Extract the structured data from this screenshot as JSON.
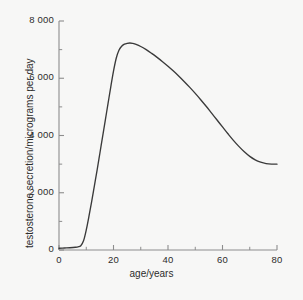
{
  "chart_data": {
    "type": "line",
    "title": "",
    "xlabel": "age/years",
    "ylabel": "testosterone secretion/micrograms per day",
    "xlim": [
      0,
      80
    ],
    "ylim": [
      0,
      8000
    ],
    "grid": false,
    "legend": null,
    "x_ticks": [
      0,
      20,
      40,
      60,
      80
    ],
    "x_tick_labels": [
      "0",
      "20",
      "40",
      "60",
      "80"
    ],
    "x_minor_ticks": [
      10,
      30,
      50,
      70
    ],
    "y_ticks": [
      0,
      2000,
      4000,
      6000,
      8000
    ],
    "y_tick_labels": [
      "0",
      "2 000",
      "4 000",
      "6 000",
      "8 000"
    ],
    "y_minor_ticks": [
      1000,
      3000,
      5000,
      7000
    ],
    "series": [
      {
        "name": "testosterone secretion",
        "color": "#3a3a3a",
        "x": [
          0,
          2,
          4,
          6,
          7,
          8,
          9,
          10,
          11,
          12,
          13,
          14,
          15,
          16,
          17,
          18,
          19,
          20,
          21,
          22,
          23,
          24,
          25,
          26,
          27,
          28,
          30,
          32,
          34,
          36,
          38,
          40,
          42,
          44,
          46,
          48,
          50,
          52,
          54,
          56,
          58,
          60,
          62,
          64,
          66,
          68,
          70,
          72,
          74,
          76,
          78,
          80
        ],
        "y": [
          60,
          70,
          80,
          95,
          110,
          150,
          320,
          700,
          1180,
          1700,
          2250,
          2800,
          3380,
          3960,
          4540,
          5120,
          5700,
          6250,
          6700,
          6980,
          7120,
          7190,
          7220,
          7230,
          7220,
          7190,
          7110,
          7000,
          6870,
          6730,
          6580,
          6420,
          6250,
          6070,
          5880,
          5680,
          5470,
          5250,
          5020,
          4780,
          4540,
          4300,
          4060,
          3830,
          3620,
          3430,
          3270,
          3150,
          3070,
          3020,
          3000,
          3000
        ]
      }
    ],
    "annotations": {
      "peak_age": 25,
      "peak_value": 7220,
      "onset_age": 8,
      "end_value": 3000
    }
  },
  "axes": {
    "plot_left_px": 59,
    "plot_right_px": 277,
    "plot_top_px": 21,
    "plot_bottom_px": 250
  }
}
